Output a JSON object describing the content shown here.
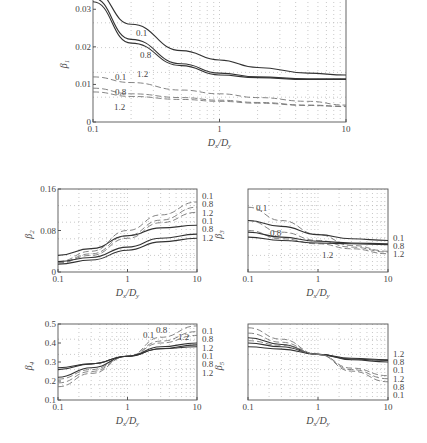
{
  "chart_data": [
    {
      "id": "beta1",
      "type": "line",
      "ylabel": "β1",
      "xlabel": "Dx/Dy",
      "xscale": "log",
      "xlim": [
        0.1,
        10
      ],
      "ylim": [
        0,
        0.033
      ],
      "xticks": [
        "0.1",
        "1",
        "10"
      ],
      "yticks": [
        "0",
        "0.01",
        "0.02",
        "0.03"
      ],
      "grid": true,
      "x": [
        0.1,
        0.2,
        0.5,
        1,
        2,
        5,
        10
      ],
      "series": [
        {
          "name": "0.1",
          "style": "solid",
          "values": [
            0.035,
            0.026,
            0.019,
            0.0165,
            0.0145,
            0.013,
            0.0125
          ]
        },
        {
          "name": "0.8",
          "style": "solid",
          "values": [
            0.033,
            0.022,
            0.0155,
            0.013,
            0.012,
            0.0115,
            0.0115
          ]
        },
        {
          "name": "1.2",
          "style": "solid",
          "values": [
            0.032,
            0.021,
            0.015,
            0.0125,
            0.0118,
            0.0113,
            0.0113
          ]
        },
        {
          "name": "0.1",
          "style": "dashed",
          "values": [
            0.012,
            0.0105,
            0.0085,
            0.0075,
            0.0065,
            0.0055,
            0.0045
          ]
        },
        {
          "name": "0.8",
          "style": "dashed",
          "values": [
            0.009,
            0.0075,
            0.0065,
            0.0058,
            0.0052,
            0.0045,
            0.0042
          ]
        },
        {
          "name": "1.2",
          "style": "dashed",
          "values": [
            0.008,
            0.0068,
            0.006,
            0.0055,
            0.005,
            0.0044,
            0.0041
          ]
        }
      ]
    },
    {
      "id": "beta2",
      "type": "line",
      "ylabel": "β2",
      "xlabel": "Dx/Dy",
      "xscale": "log",
      "xlim": [
        0.1,
        10
      ],
      "ylim": [
        0,
        0.16
      ],
      "xticks": [
        "0.1",
        "1",
        "10"
      ],
      "yticks": [
        "0",
        "0.08",
        "0.16"
      ],
      "grid": true,
      "x": [
        0.1,
        0.3,
        1,
        3,
        10
      ],
      "series": [
        {
          "name": "0.1",
          "style": "dashed",
          "values": [
            0.02,
            0.04,
            0.08,
            0.11,
            0.135
          ]
        },
        {
          "name": "0.8",
          "style": "dashed",
          "values": [
            0.018,
            0.035,
            0.07,
            0.1,
            0.125
          ]
        },
        {
          "name": "1.2",
          "style": "dashed",
          "values": [
            0.017,
            0.032,
            0.065,
            0.095,
            0.115
          ]
        },
        {
          "name": "0.1",
          "style": "solid",
          "values": [
            0.032,
            0.045,
            0.07,
            0.085,
            0.09
          ]
        },
        {
          "name": "0.8",
          "style": "solid",
          "values": [
            0.02,
            0.028,
            0.048,
            0.065,
            0.073
          ]
        },
        {
          "name": "1.2",
          "style": "solid",
          "values": [
            0.015,
            0.023,
            0.042,
            0.058,
            0.065
          ]
        }
      ]
    },
    {
      "id": "beta3",
      "type": "line",
      "ylabel": "β3",
      "xlabel": "Dx/Dy",
      "xscale": "log",
      "xlim": [
        0.1,
        10
      ],
      "ylim": [
        0,
        1
      ],
      "xticks": [
        "0.1",
        "1",
        "10"
      ],
      "yticks": [],
      "grid": true,
      "x": [
        0.1,
        0.3,
        1,
        3,
        10
      ],
      "series": [
        {
          "name": "0.1",
          "style": "dashed",
          "values": [
            0.78,
            0.62,
            0.45,
            0.32,
            0.25
          ]
        },
        {
          "name": "0.8",
          "style": "dashed",
          "values": [
            0.62,
            0.48,
            0.38,
            0.3,
            0.24
          ]
        },
        {
          "name": "1.2",
          "style": "dashed",
          "values": [
            0.5,
            0.4,
            0.34,
            0.28,
            0.22
          ]
        },
        {
          "name": "0.1",
          "style": "solid",
          "values": [
            0.62,
            0.55,
            0.45,
            0.4,
            0.38
          ]
        },
        {
          "name": "0.8",
          "style": "solid",
          "values": [
            0.48,
            0.42,
            0.37,
            0.35,
            0.34
          ]
        },
        {
          "name": "1.2",
          "style": "solid",
          "values": [
            0.42,
            0.38,
            0.35,
            0.34,
            0.33
          ]
        }
      ]
    },
    {
      "id": "beta4",
      "type": "line",
      "ylabel": "β4",
      "xlabel": "Dx/Dy",
      "xscale": "log",
      "xlim": [
        0.1,
        10
      ],
      "ylim": [
        0.1,
        0.5
      ],
      "xticks": [
        "0.1",
        "1",
        "10"
      ],
      "yticks": [
        "0.1",
        "0.2",
        "0.3",
        "0.4",
        "0.5"
      ],
      "grid": true,
      "x": [
        0.1,
        0.3,
        1,
        3,
        10
      ],
      "series": [
        {
          "name": "0.1",
          "style": "dashed",
          "values": [
            0.17,
            0.24,
            0.33,
            0.43,
            0.49
          ]
        },
        {
          "name": "0.8",
          "style": "dashed",
          "values": [
            0.19,
            0.25,
            0.33,
            0.41,
            0.46
          ]
        },
        {
          "name": "1.2",
          "style": "dashed",
          "values": [
            0.21,
            0.26,
            0.33,
            0.4,
            0.44
          ]
        },
        {
          "name": "0.1",
          "style": "solid",
          "values": [
            0.27,
            0.29,
            0.33,
            0.38,
            0.4
          ]
        },
        {
          "name": "0.8",
          "style": "solid",
          "values": [
            0.26,
            0.29,
            0.33,
            0.37,
            0.39
          ]
        },
        {
          "name": "1.2",
          "style": "solid",
          "values": [
            0.22,
            0.27,
            0.33,
            0.37,
            0.38
          ]
        }
      ]
    },
    {
      "id": "beta5",
      "type": "line",
      "ylabel": "β5",
      "xlabel": "Dx/Dy",
      "xscale": "log",
      "xlim": [
        0.1,
        10
      ],
      "ylim": [
        0,
        1
      ],
      "xticks": [
        "0.1",
        "1",
        "10"
      ],
      "yticks": [],
      "grid": true,
      "x": [
        0.1,
        0.3,
        1,
        3,
        10
      ],
      "series": [
        {
          "name": "1.2",
          "style": "solid",
          "values": [
            0.82,
            0.73,
            0.6,
            0.55,
            0.53
          ]
        },
        {
          "name": "0.8",
          "style": "solid",
          "values": [
            0.75,
            0.7,
            0.6,
            0.54,
            0.52
          ]
        },
        {
          "name": "0.1",
          "style": "solid",
          "values": [
            0.7,
            0.67,
            0.6,
            0.53,
            0.5
          ]
        },
        {
          "name": "1.2",
          "style": "dashed",
          "values": [
            0.95,
            0.8,
            0.6,
            0.42,
            0.32
          ]
        },
        {
          "name": "0.8",
          "style": "dashed",
          "values": [
            0.88,
            0.76,
            0.6,
            0.4,
            0.28
          ]
        },
        {
          "name": "0.1",
          "style": "dashed",
          "values": [
            0.78,
            0.72,
            0.6,
            0.38,
            0.24
          ]
        }
      ]
    }
  ],
  "panels": {
    "beta1": {
      "ylabel": "β",
      "ysub": "1",
      "xlabel_main": "D",
      "xlabel_sub1": "x",
      "xlabel_sep": "/D",
      "xlabel_sub2": "y"
    },
    "beta2": {
      "ylabel": "β",
      "ysub": "2"
    },
    "beta3": {
      "ylabel": "β",
      "ysub": "3"
    },
    "beta4": {
      "ylabel": "β",
      "ysub": "4"
    },
    "beta5": {
      "ylabel": "β",
      "ysub": "5"
    }
  }
}
